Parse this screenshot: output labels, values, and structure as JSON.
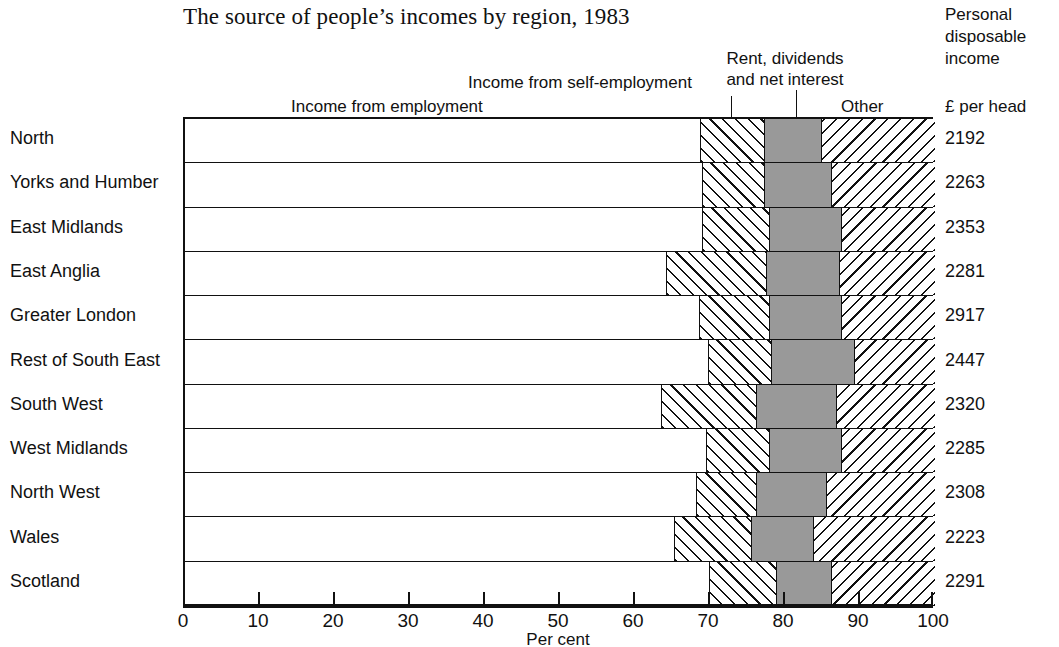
{
  "title": "The source of people’s incomes by region, 1983",
  "callouts": {
    "employment": "Income from employment",
    "self_employment": "Income from self-employment",
    "rent_line1": "Rent, dividends",
    "rent_line2": "and net interest",
    "other": "Other",
    "per_head": "£ per head"
  },
  "pdi_caption": {
    "line1": "Personal",
    "line2": "disposable",
    "line3": "income"
  },
  "axis": {
    "title": "Per cent",
    "ticks": [
      "0",
      "10",
      "20",
      "30",
      "40",
      "50",
      "60",
      "70",
      "80",
      "90",
      "100"
    ],
    "min": 0,
    "max": 100
  },
  "colors": {
    "employment": "#ffffff",
    "self_employment": "#ffffff",
    "rent": "#999999",
    "other": "#ffffff",
    "outline": "#111111"
  },
  "chart_data": {
    "type": "bar",
    "orientation": "horizontal",
    "stacked": true,
    "title": "The source of people’s incomes by region, 1983",
    "xlabel": "Per cent",
    "ylabel": "",
    "xlim": [
      0,
      100
    ],
    "grid": false,
    "legend": "inline-callouts",
    "categories": [
      "North",
      "Yorks and Humber",
      "East Midlands",
      "East Anglia",
      "Greater London",
      "Rest of South East",
      "South West",
      "West Midlands",
      "North West",
      "Wales",
      "Scotland"
    ],
    "series": [
      {
        "name": "Income from employment",
        "fill": "white",
        "values": [
          68.8,
          69.1,
          69.1,
          64.3,
          68.7,
          69.9,
          63.6,
          69.6,
          68.3,
          65.3,
          70.0
        ]
      },
      {
        "name": "Income from self-employment",
        "fill": "forward-hatch",
        "values": [
          8.5,
          8.2,
          8.9,
          13.3,
          9.3,
          8.4,
          12.7,
          8.4,
          8.0,
          10.3,
          8.9
        ]
      },
      {
        "name": "Rent, dividends and net interest",
        "fill": "grey",
        "values": [
          7.6,
          9.0,
          9.6,
          9.7,
          9.6,
          11.0,
          10.6,
          9.6,
          9.3,
          8.3,
          7.4
        ]
      },
      {
        "name": "Other",
        "fill": "backward-hatch",
        "values": [
          15.1,
          13.7,
          12.4,
          12.7,
          12.4,
          10.7,
          13.1,
          12.4,
          14.4,
          16.1,
          13.7
        ]
      }
    ],
    "secondary_axis": {
      "header_line1": "Personal",
      "header_line2": "disposable",
      "header_line3": "income",
      "header_units": "£ per head",
      "values": [
        2192,
        2263,
        2353,
        2281,
        2917,
        2447,
        2320,
        2285,
        2308,
        2223,
        2291
      ]
    }
  }
}
